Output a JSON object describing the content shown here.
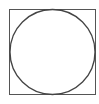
{
  "diagram": {
    "shapes": [
      {
        "type": "square",
        "x": 9,
        "y": 9,
        "width": 87,
        "height": 86,
        "stroke": "#555555"
      },
      {
        "type": "circle",
        "cx": 52.5,
        "cy": 52,
        "r": 43,
        "stroke": "#444444"
      }
    ],
    "background": "#ffffff"
  }
}
